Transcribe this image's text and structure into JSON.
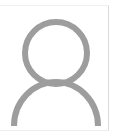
{
  "image": {
    "width": 117,
    "height": 138,
    "background_color": "#ffffff"
  },
  "avatar": {
    "name": "Default user avatar placeholder",
    "alt_text": "User profile placeholder",
    "icon_name": "user-person-icon",
    "stroke_color": "#9d9d9d",
    "fill_color": "none",
    "background_color": "#ffffff",
    "stroke_width": 6
  },
  "card": {
    "background_color": "#ffffff",
    "border_top_color": "#efefef",
    "border_right_color": "#d9d9d9",
    "border_bottom_color": "#ececec"
  }
}
